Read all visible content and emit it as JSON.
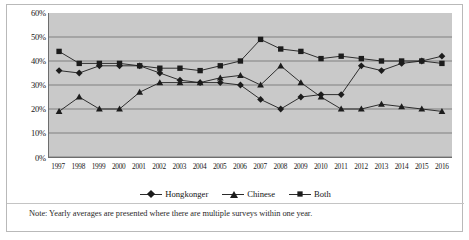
{
  "note": {
    "text": "Note: Yearly averages are presented where there are multiple surveys within one year."
  },
  "legend": {
    "position": "bottom-center",
    "items": [
      {
        "label": "Hongkonger",
        "marker": "diamond",
        "marker_icon": "diamond-marker-icon",
        "color": "#1c1c1c"
      },
      {
        "label": "Chinese",
        "marker": "triangle",
        "marker_icon": "triangle-marker-icon",
        "color": "#1c1c1c"
      },
      {
        "label": "Both",
        "marker": "square",
        "marker_icon": "square-marker-icon",
        "color": "#1c1c1c"
      }
    ]
  },
  "axis": {
    "y_ticks": [
      "0%",
      "10%",
      "20%",
      "30%",
      "40%",
      "50%",
      "60%"
    ],
    "x_ticks": [
      "1997",
      "1998",
      "1999",
      "2000",
      "2001",
      "2002",
      "2003",
      "2004",
      "2005",
      "2006",
      "2007",
      "2008",
      "2009",
      "2010",
      "2011",
      "2012",
      "2013",
      "2014",
      "2015",
      "2016"
    ]
  },
  "colors": {
    "plot_background": "#c9c9c9",
    "gridline": "#6d6d6d",
    "series": "#1c1c1c",
    "frame": "#b9b9b9"
  },
  "chart_data": {
    "type": "line",
    "title": "",
    "subtitle": "",
    "xlabel": "",
    "ylabel": "",
    "ylim": [
      0,
      60
    ],
    "ytick_interval": 10,
    "y_unit": "%",
    "grid": true,
    "legend_position": "bottom-center",
    "annotations": [
      "Note: Yearly averages are presented where there are multiple surveys within one year."
    ],
    "categories": [
      "1997",
      "1998",
      "1999",
      "2000",
      "2001",
      "2002",
      "2003",
      "2004",
      "2005",
      "2006",
      "2007",
      "2008",
      "2009",
      "2010",
      "2011",
      "2012",
      "2013",
      "2014",
      "2015",
      "2016"
    ],
    "series": [
      {
        "name": "Hongkonger",
        "marker": "diamond",
        "values": [
          36,
          35,
          38,
          38,
          38,
          35,
          32,
          31,
          31,
          30,
          24,
          20,
          25,
          26,
          26,
          38,
          36,
          39,
          40,
          42
        ]
      },
      {
        "name": "Chinese",
        "marker": "triangle",
        "values": [
          19,
          25,
          20,
          20,
          27,
          31,
          31,
          31,
          33,
          34,
          30,
          38,
          31,
          25,
          20,
          20,
          22,
          21,
          20,
          19
        ]
      },
      {
        "name": "Both",
        "marker": "square",
        "values": [
          44,
          39,
          39,
          39,
          38,
          37,
          37,
          36,
          38,
          40,
          49,
          45,
          44,
          41,
          42,
          41,
          40,
          40,
          40,
          39
        ]
      }
    ]
  }
}
